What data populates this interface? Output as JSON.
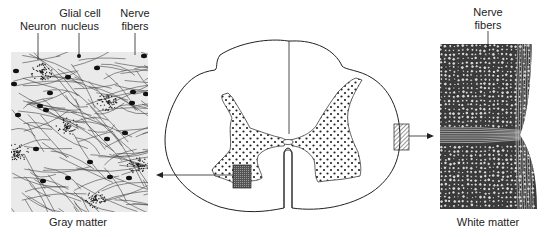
{
  "figure": {
    "left_panel": {
      "caption": "Gray matter",
      "callouts": [
        {
          "id": "neuron",
          "lines": [
            "Neuron"
          ]
        },
        {
          "id": "glial",
          "lines": [
            "Glial cell",
            "nucleus"
          ]
        },
        {
          "id": "fibers",
          "lines": [
            "Nerve",
            "fibers"
          ]
        }
      ]
    },
    "center_panel": {
      "subject": "spinal-cord-cross-section"
    },
    "right_panel": {
      "caption": "White matter",
      "callouts": [
        {
          "id": "fibers",
          "lines": [
            "Nerve",
            "fibers"
          ]
        }
      ]
    },
    "colors": {
      "ink": "#222222",
      "paper": "#ffffff",
      "panel_bg": "#e9e9e9",
      "dense": "#3a3a3a"
    }
  }
}
